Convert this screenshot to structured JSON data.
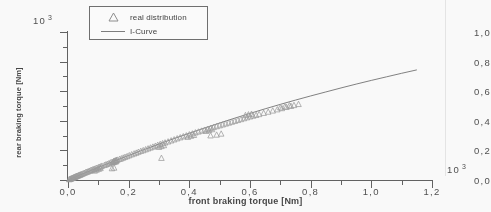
{
  "chart_data": {
    "type": "scatter",
    "title": "",
    "xlabel": "front braking torque  [Nm]",
    "ylabel": "rear braking torque  [Nm]",
    "x_exponent": "10",
    "x_exponent_power": "3",
    "y_exponent": "10",
    "y_exponent_power": "3",
    "xlim": [
      0.0,
      1.2
    ],
    "ylim": [
      0.0,
      1.0
    ],
    "xticks": [
      "0,0",
      "0,2",
      "0,4",
      "0,6",
      "0,8",
      "1,0",
      "1,2"
    ],
    "xtick_values": [
      0.0,
      0.2,
      0.4,
      0.6,
      0.8,
      1.0,
      1.2
    ],
    "yticks": [
      "1,0",
      "0,8",
      "0,6",
      "0,4",
      "0,2",
      "0,0"
    ],
    "ytick_values": [
      1.0,
      0.8,
      0.6,
      0.4,
      0.2,
      0.0
    ],
    "grid": false,
    "legend_position": "upper-left",
    "series": [
      {
        "name": "real distribution",
        "type": "scatter",
        "marker": "triangle-up",
        "color": "#9a9a9a",
        "points": [
          [
            0.004,
            0.004
          ],
          [
            0.006,
            0.005
          ],
          [
            0.008,
            0.007
          ],
          [
            0.01,
            0.009
          ],
          [
            0.012,
            0.01
          ],
          [
            0.014,
            0.013
          ],
          [
            0.016,
            0.014
          ],
          [
            0.018,
            0.016
          ],
          [
            0.02,
            0.018
          ],
          [
            0.022,
            0.019
          ],
          [
            0.024,
            0.022
          ],
          [
            0.026,
            0.023
          ],
          [
            0.028,
            0.025
          ],
          [
            0.03,
            0.027
          ],
          [
            0.033,
            0.029
          ],
          [
            0.035,
            0.031
          ],
          [
            0.038,
            0.034
          ],
          [
            0.04,
            0.035
          ],
          [
            0.043,
            0.038
          ],
          [
            0.046,
            0.04
          ],
          [
            0.05,
            0.044
          ],
          [
            0.054,
            0.047
          ],
          [
            0.058,
            0.051
          ],
          [
            0.062,
            0.054
          ],
          [
            0.066,
            0.057
          ],
          [
            0.07,
            0.061
          ],
          [
            0.074,
            0.064
          ],
          [
            0.078,
            0.067
          ],
          [
            0.082,
            0.071
          ],
          [
            0.086,
            0.074
          ],
          [
            0.09,
            0.077
          ],
          [
            0.095,
            0.081
          ],
          [
            0.1,
            0.085
          ],
          [
            0.104,
            0.088
          ],
          [
            0.108,
            0.091
          ],
          [
            0.112,
            0.095
          ],
          [
            0.088,
            0.062
          ],
          [
            0.094,
            0.068
          ],
          [
            0.101,
            0.074
          ],
          [
            0.107,
            0.079
          ],
          [
            0.12,
            0.1
          ],
          [
            0.125,
            0.104
          ],
          [
            0.13,
            0.108
          ],
          [
            0.135,
            0.112
          ],
          [
            0.14,
            0.117
          ],
          [
            0.145,
            0.121
          ],
          [
            0.15,
            0.125
          ],
          [
            0.152,
            0.128
          ],
          [
            0.155,
            0.13
          ],
          [
            0.158,
            0.132
          ],
          [
            0.16,
            0.134
          ],
          [
            0.163,
            0.136
          ],
          [
            0.148,
            0.118
          ],
          [
            0.151,
            0.12
          ],
          [
            0.156,
            0.123
          ],
          [
            0.159,
            0.126
          ],
          [
            0.145,
            0.078
          ],
          [
            0.152,
            0.082
          ],
          [
            0.17,
            0.141
          ],
          [
            0.176,
            0.145
          ],
          [
            0.182,
            0.15
          ],
          [
            0.188,
            0.155
          ],
          [
            0.195,
            0.16
          ],
          [
            0.202,
            0.166
          ],
          [
            0.21,
            0.172
          ],
          [
            0.218,
            0.178
          ],
          [
            0.225,
            0.183
          ],
          [
            0.232,
            0.189
          ],
          [
            0.24,
            0.195
          ],
          [
            0.248,
            0.2
          ],
          [
            0.256,
            0.206
          ],
          [
            0.264,
            0.212
          ],
          [
            0.272,
            0.218
          ],
          [
            0.28,
            0.224
          ],
          [
            0.288,
            0.23
          ],
          [
            0.296,
            0.236
          ],
          [
            0.304,
            0.242
          ],
          [
            0.312,
            0.247
          ],
          [
            0.3,
            0.222
          ],
          [
            0.308,
            0.228
          ],
          [
            0.316,
            0.234
          ],
          [
            0.308,
            0.148
          ],
          [
            0.32,
            0.252
          ],
          [
            0.33,
            0.259
          ],
          [
            0.34,
            0.266
          ],
          [
            0.35,
            0.273
          ],
          [
            0.36,
            0.28
          ],
          [
            0.37,
            0.287
          ],
          [
            0.38,
            0.294
          ],
          [
            0.39,
            0.3
          ],
          [
            0.4,
            0.307
          ],
          [
            0.41,
            0.313
          ],
          [
            0.42,
            0.32
          ],
          [
            0.43,
            0.326
          ],
          [
            0.395,
            0.29
          ],
          [
            0.405,
            0.297
          ],
          [
            0.415,
            0.303
          ],
          [
            0.44,
            0.332
          ],
          [
            0.45,
            0.338
          ],
          [
            0.46,
            0.344
          ],
          [
            0.47,
            0.35
          ],
          [
            0.48,
            0.356
          ],
          [
            0.49,
            0.362
          ],
          [
            0.5,
            0.368
          ],
          [
            0.51,
            0.374
          ],
          [
            0.455,
            0.33
          ],
          [
            0.465,
            0.336
          ],
          [
            0.475,
            0.342
          ],
          [
            0.47,
            0.3
          ],
          [
            0.49,
            0.305
          ],
          [
            0.505,
            0.312
          ],
          [
            0.52,
            0.38
          ],
          [
            0.53,
            0.386
          ],
          [
            0.54,
            0.392
          ],
          [
            0.55,
            0.398
          ],
          [
            0.56,
            0.404
          ],
          [
            0.57,
            0.41
          ],
          [
            0.58,
            0.416
          ],
          [
            0.59,
            0.422
          ],
          [
            0.6,
            0.428
          ],
          [
            0.61,
            0.433
          ],
          [
            0.62,
            0.438
          ],
          [
            0.585,
            0.437
          ],
          [
            0.595,
            0.442
          ],
          [
            0.605,
            0.446
          ],
          [
            0.63,
            0.444
          ],
          [
            0.645,
            0.452
          ],
          [
            0.66,
            0.46
          ],
          [
            0.675,
            0.468
          ],
          [
            0.69,
            0.476
          ],
          [
            0.705,
            0.484
          ],
          [
            0.72,
            0.492
          ],
          [
            0.735,
            0.499
          ],
          [
            0.7,
            0.489
          ],
          [
            0.715,
            0.496
          ],
          [
            0.73,
            0.503
          ],
          [
            0.745,
            0.505
          ],
          [
            0.76,
            0.512
          ]
        ]
      },
      {
        "name": "I-Curve",
        "type": "line",
        "color": "#6f6f6f",
        "points": [
          [
            0.0,
            0.0
          ],
          [
            0.05,
            0.043
          ],
          [
            0.1,
            0.085
          ],
          [
            0.15,
            0.126
          ],
          [
            0.2,
            0.166
          ],
          [
            0.25,
            0.205
          ],
          [
            0.3,
            0.243
          ],
          [
            0.35,
            0.28
          ],
          [
            0.4,
            0.316
          ],
          [
            0.45,
            0.351
          ],
          [
            0.5,
            0.385
          ],
          [
            0.55,
            0.418
          ],
          [
            0.6,
            0.45
          ],
          [
            0.65,
            0.481
          ],
          [
            0.7,
            0.511
          ],
          [
            0.75,
            0.54
          ],
          [
            0.8,
            0.568
          ],
          [
            0.85,
            0.595
          ],
          [
            0.9,
            0.622
          ],
          [
            0.95,
            0.648
          ],
          [
            1.0,
            0.673
          ],
          [
            1.05,
            0.697
          ],
          [
            1.1,
            0.721
          ],
          [
            1.15,
            0.744
          ]
        ]
      }
    ]
  },
  "legend": {
    "entries": [
      {
        "label": "real distribution",
        "marker": "triangle-up"
      },
      {
        "label": "I-Curve",
        "marker": "line"
      }
    ]
  },
  "axes": {
    "x_title": "front braking torque  [Nm]",
    "y_title": "rear braking torque  [Nm]",
    "x_exponent_base": "10",
    "x_exponent_power": "3",
    "y_exponent_base": "10",
    "y_exponent_power": "3"
  }
}
